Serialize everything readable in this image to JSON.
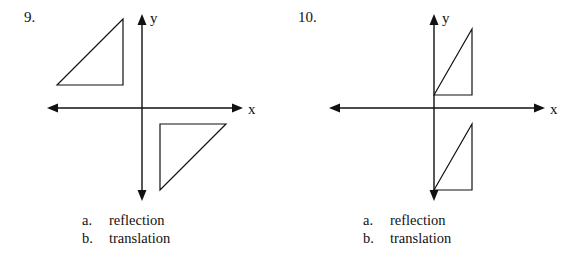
{
  "problems": [
    {
      "number": "9.",
      "axes": {
        "x_label": "x",
        "y_label": "y"
      },
      "shapes": [
        {
          "name": "triangle-upper-left",
          "points": "57,85 123,19 123,85"
        },
        {
          "name": "triangle-lower-right",
          "points": "160,124 226,124 160,190"
        }
      ],
      "options": [
        {
          "letter": "a.",
          "text": "reflection"
        },
        {
          "letter": "b.",
          "text": "translation"
        }
      ]
    },
    {
      "number": "10.",
      "axes": {
        "x_label": "x",
        "y_label": "y"
      },
      "shapes": [
        {
          "name": "triangle-upper-right",
          "points": "142,95 180,29 180,95"
        },
        {
          "name": "triangle-lower-right",
          "points": "142,190 180,124 180,190"
        }
      ],
      "options": [
        {
          "letter": "a.",
          "text": "reflection"
        },
        {
          "letter": "b.",
          "text": "translation"
        }
      ]
    }
  ],
  "colors": {
    "ink": "#111111",
    "background": "#ffffff"
  }
}
